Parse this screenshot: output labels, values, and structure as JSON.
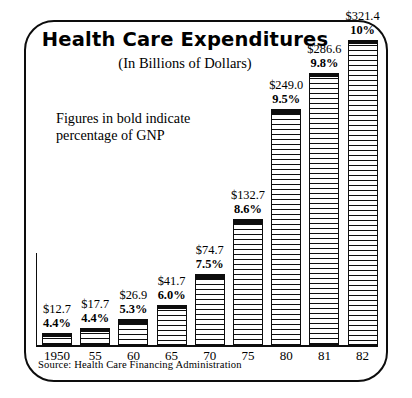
{
  "figure": {
    "title": "Health Care Expenditures",
    "subtitle": "(In Billions of Dollars)",
    "note_line1": "Figures in bold indicate",
    "note_line2": "percentage of GNP",
    "source": "Source: Health Care Financing Administration"
  },
  "chart_data": {
    "type": "bar",
    "title": "Health Care Expenditures",
    "subtitle": "(In Billions of Dollars)",
    "xlabel": "",
    "ylabel": "",
    "ylim": [
      0,
      321.4
    ],
    "grid": false,
    "legend": null,
    "annotations": [
      "Figures in bold indicate percentage of GNP",
      "Source: Health Care Financing Administration"
    ],
    "categories": [
      "1950",
      "55",
      "60",
      "65",
      "70",
      "75",
      "80",
      "81",
      "82"
    ],
    "values": [
      12.7,
      17.7,
      26.9,
      41.7,
      74.7,
      132.7,
      249.0,
      286.6,
      321.4
    ],
    "value_labels": [
      "$12.7",
      "$17.7",
      "$26.9",
      "$41.7",
      "$74.7",
      "$132.7",
      "$249.0",
      "$286.6",
      "$321.4"
    ],
    "series": [
      {
        "name": "Expenditures (billions of dollars)",
        "values": [
          12.7,
          17.7,
          26.9,
          41.7,
          74.7,
          132.7,
          249.0,
          286.6,
          321.4
        ]
      },
      {
        "name": "Percentage of GNP",
        "values": [
          4.4,
          4.4,
          5.3,
          6.0,
          7.5,
          8.6,
          9.5,
          9.8,
          10.0
        ]
      }
    ],
    "percent_labels": [
      "4.4%",
      "4.4%",
      "5.3%",
      "6.0%",
      "7.5%",
      "8.6%",
      "9.5%",
      "9.8%",
      "10%"
    ]
  },
  "colors": {
    "ink": "#0d0d0d",
    "paper": "#ffffff"
  }
}
